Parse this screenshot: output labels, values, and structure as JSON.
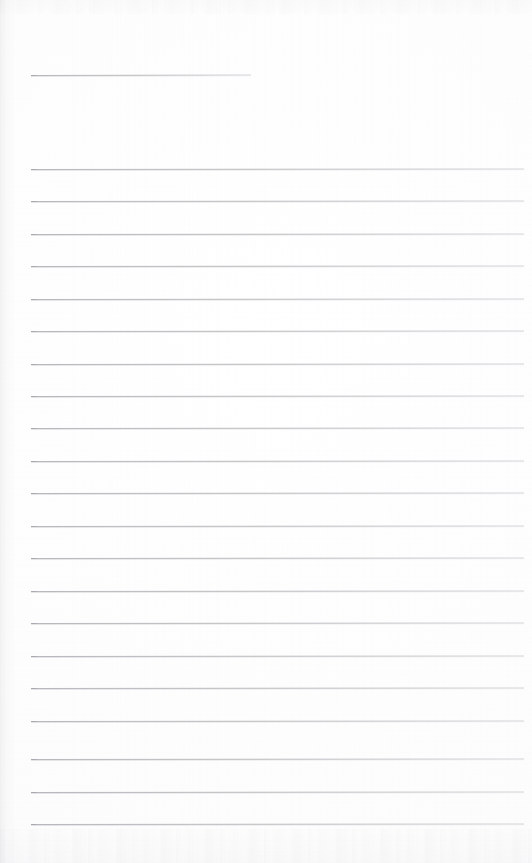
{
  "document": {
    "kind": "scanned-blank-ruled-page",
    "title_text": "",
    "body_text": "",
    "page_width": 532,
    "page_height": 863,
    "background_color": "#fdfdfd",
    "rule_color": "#b9b9bd",
    "rule_color_soft": "#c6c6cb",
    "rule_color_faint": "#d6d6db",
    "rule_tick_color": "#a9a9b0",
    "has_visible_text": "no",
    "notes_text": ""
  },
  "header_rule": {
    "label": "signature-or-title-blank",
    "value_text": "",
    "x": 31,
    "y": 75,
    "width": 220
  },
  "body_rules": {
    "label": "ruled-writing-lines",
    "first_y": 169,
    "spacing": 32.4,
    "x": 31,
    "width": 493,
    "count": 21,
    "lines": [
      {
        "index": 1,
        "y": 169,
        "value_text": ""
      },
      {
        "index": 2,
        "y": 201,
        "value_text": ""
      },
      {
        "index": 3,
        "y": 234,
        "value_text": ""
      },
      {
        "index": 4,
        "y": 266,
        "value_text": ""
      },
      {
        "index": 5,
        "y": 299,
        "value_text": ""
      },
      {
        "index": 6,
        "y": 331,
        "value_text": ""
      },
      {
        "index": 7,
        "y": 364,
        "value_text": ""
      },
      {
        "index": 8,
        "y": 396,
        "value_text": ""
      },
      {
        "index": 9,
        "y": 428,
        "value_text": ""
      },
      {
        "index": 10,
        "y": 461,
        "value_text": ""
      },
      {
        "index": 11,
        "y": 493,
        "value_text": ""
      },
      {
        "index": 12,
        "y": 526,
        "value_text": ""
      },
      {
        "index": 13,
        "y": 558,
        "value_text": ""
      },
      {
        "index": 14,
        "y": 591,
        "value_text": ""
      },
      {
        "index": 15,
        "y": 623,
        "value_text": ""
      },
      {
        "index": 16,
        "y": 656,
        "value_text": ""
      },
      {
        "index": 17,
        "y": 688,
        "value_text": ""
      },
      {
        "index": 18,
        "y": 721,
        "value_text": ""
      },
      {
        "index": 19,
        "y": 759,
        "value_text": ""
      },
      {
        "index": 20,
        "y": 792,
        "value_text": ""
      },
      {
        "index": 21,
        "y": 824,
        "value_text": ""
      }
    ]
  }
}
